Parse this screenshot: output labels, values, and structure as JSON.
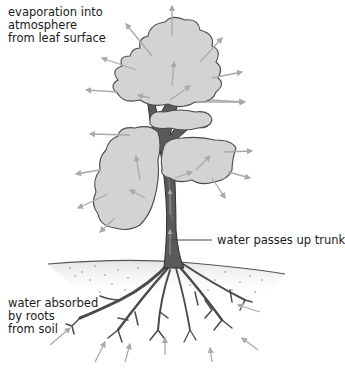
{
  "diagram": {
    "labels": {
      "evaporation": [
        "evaporation into",
        "atmosphere",
        "from leaf surface"
      ],
      "trunk": "water passes up trunk",
      "roots": [
        "water absorbed",
        "by roots",
        "from soil"
      ]
    },
    "colors": {
      "foliage_fill": "#d3d3d3",
      "foliage_outline": "#4a4a4a",
      "trunk_fill": "#5a5a5a",
      "trunk_outline": "#2e2e2e",
      "arrow": "#aaaaaa",
      "soil": "#ececec",
      "soil_dots": "#8a8a8a",
      "label_text": "#1a1a1a"
    },
    "elements": [
      "tree-canopy",
      "tree-trunk",
      "branches",
      "soil-layer",
      "root-system",
      "evaporation-arrows",
      "trunk-flow-arrows",
      "root-absorption-arrows"
    ]
  }
}
